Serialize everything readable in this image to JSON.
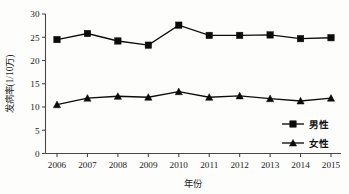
{
  "chart_data": {
    "type": "line",
    "title": "",
    "subtitle": "",
    "xlabel": "年份",
    "ylabel": "发病率(1/10万)",
    "categories": [
      "2006",
      "2007",
      "2008",
      "2009",
      "2010",
      "2011",
      "2012",
      "2013",
      "2014",
      "2015"
    ],
    "x": [
      2006,
      2007,
      2008,
      2009,
      2010,
      2011,
      2012,
      2013,
      2014,
      2015
    ],
    "xlim": [
      2006,
      2015
    ],
    "ylim": [
      0,
      30
    ],
    "yticks": [
      0,
      5,
      10,
      15,
      20,
      25,
      30
    ],
    "ytick_labels": [
      "0",
      "5",
      "10",
      "15",
      "20",
      "25",
      "30"
    ],
    "xtick_labels": [
      "2006",
      "2007",
      "2008",
      "2009",
      "2010",
      "2011",
      "2012",
      "2013",
      "2014",
      "2015"
    ],
    "grid": false,
    "legend_position": "lower-right",
    "series": [
      {
        "name": "男性",
        "marker": "square",
        "color": "#0b0b0b",
        "values": [
          24.5,
          25.8,
          24.2,
          23.3,
          27.6,
          25.4,
          25.4,
          25.5,
          24.7,
          24.9
        ]
      },
      {
        "name": "女性",
        "marker": "triangle",
        "color": "#0b0b0b",
        "values": [
          10.5,
          11.9,
          12.3,
          12.1,
          13.3,
          12.1,
          12.4,
          11.8,
          11.3,
          11.9
        ]
      }
    ],
    "annotations": []
  },
  "legend": {
    "items": [
      {
        "label": "男性",
        "marker": "square"
      },
      {
        "label": "女性",
        "marker": "triangle"
      }
    ]
  },
  "axes": {
    "y_axis_title": "发病率(1/10万)",
    "x_axis_title": "年份"
  }
}
